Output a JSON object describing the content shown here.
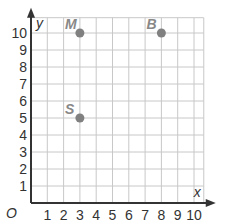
{
  "chart_data": {
    "type": "scatter",
    "title": "",
    "xlabel": "x",
    "ylabel": "y",
    "origin_label": "O",
    "xlim": [
      0,
      10
    ],
    "ylim": [
      0,
      10
    ],
    "grid": true,
    "x_ticks": [
      "1",
      "2",
      "3",
      "4",
      "5",
      "6",
      "7",
      "8",
      "9",
      "10"
    ],
    "y_ticks": [
      "1",
      "2",
      "3",
      "4",
      "5",
      "6",
      "7",
      "8",
      "9",
      "10"
    ],
    "points": [
      {
        "label": "M",
        "x": 3,
        "y": 10
      },
      {
        "label": "B",
        "x": 8,
        "y": 10
      },
      {
        "label": "S",
        "x": 3,
        "y": 5
      }
    ],
    "colors": {
      "grid": "#c8c8c8",
      "axis": "#333333",
      "point": "#808080"
    }
  }
}
